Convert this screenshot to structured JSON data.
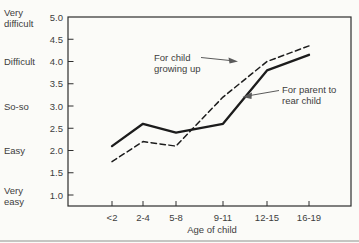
{
  "chart_data": {
    "type": "line",
    "title": "",
    "xlabel": "Age of child",
    "categories": [
      "<2",
      "2-4",
      "5-8",
      "9-11",
      "12-15",
      "16-19"
    ],
    "series": [
      {
        "name": "For child growing up",
        "style": "dashed",
        "values": [
          1.75,
          2.2,
          2.1,
          3.2,
          4.0,
          4.35
        ]
      },
      {
        "name": "For parent to rear child",
        "style": "solid",
        "values": [
          2.1,
          2.6,
          2.4,
          2.6,
          3.8,
          4.15
        ]
      }
    ],
    "ylim": [
      1.0,
      5.0
    ],
    "ytick_step": 0.5,
    "ytick_labels": [
      "5.0",
      "4.5",
      "4.0",
      "3.5",
      "3.0",
      "2.5",
      "2.0",
      "1.5",
      "1.0"
    ],
    "y_category_labels": [
      {
        "lines": [
          "Very",
          "difficult"
        ],
        "value": 5.0
      },
      {
        "lines": [
          "Difficult"
        ],
        "value": 4.0
      },
      {
        "lines": [
          "So-so"
        ],
        "value": 3.0
      },
      {
        "lines": [
          "Easy"
        ],
        "value": 2.0
      },
      {
        "lines": [
          "Very",
          "easy"
        ],
        "value": 1.0
      }
    ],
    "grid": false,
    "legend_position": "inline-annotations",
    "annotations": [
      {
        "lines": [
          "For child",
          "growing up"
        ],
        "target_series": "For child growing up",
        "arrow_dir": "right"
      },
      {
        "lines": [
          "For parent to",
          "rear child"
        ],
        "target_series": "For parent to rear child",
        "arrow_dir": "left"
      }
    ],
    "colors": {
      "line": "#1c1c1c",
      "text": "#3d3d3d",
      "axis": "#2e2e2e",
      "arrow": "#5a5a5a",
      "background": "#fbfbf8",
      "page_rule": "#8f8f8c"
    }
  }
}
